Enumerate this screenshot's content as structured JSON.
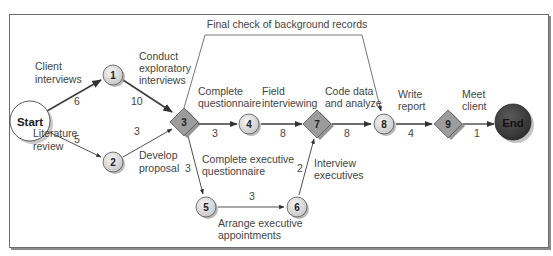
{
  "diagram": {
    "type": "PERT network (activity-on-arrow)",
    "colors": {
      "frame_border": "#6d6d6d",
      "edge": "#444444",
      "circle_node_fill": "#dcdcdc",
      "diamond_node_fill": "#9a9a9a",
      "start_fill": "#ffffff",
      "end_fill": "#3a3a3a",
      "text": "#444444"
    },
    "nodes": [
      {
        "id": "start",
        "label": "Start",
        "shape": "circle-large"
      },
      {
        "id": "1",
        "label": "1",
        "shape": "circle"
      },
      {
        "id": "2",
        "label": "2",
        "shape": "circle"
      },
      {
        "id": "3",
        "label": "3",
        "shape": "diamond"
      },
      {
        "id": "4",
        "label": "4",
        "shape": "circle"
      },
      {
        "id": "5",
        "label": "5",
        "shape": "circle"
      },
      {
        "id": "6",
        "label": "6",
        "shape": "circle"
      },
      {
        "id": "7",
        "label": "7",
        "shape": "diamond"
      },
      {
        "id": "8",
        "label": "8",
        "shape": "circle"
      },
      {
        "id": "9",
        "label": "9",
        "shape": "diamond"
      },
      {
        "id": "end",
        "label": "End",
        "shape": "circle-large-dark"
      }
    ],
    "edges": [
      {
        "from": "start",
        "to": "1",
        "duration": "6",
        "activity": [
          "Client",
          "interviews"
        ],
        "critical": true
      },
      {
        "from": "start",
        "to": "2",
        "duration": "5",
        "activity": [
          "Literature",
          "review"
        ],
        "critical": false
      },
      {
        "from": "1",
        "to": "3",
        "duration": "10",
        "activity": [
          "Conduct",
          "exploratory",
          "interviews"
        ],
        "critical": true
      },
      {
        "from": "2",
        "to": "3",
        "duration": "3",
        "activity": [
          "Develop",
          "proposal"
        ],
        "critical": false
      },
      {
        "from": "3",
        "to": "4",
        "duration": "3",
        "activity": [
          "Complete",
          "questionnaire"
        ],
        "critical": true
      },
      {
        "from": "3",
        "to": "5",
        "duration": "3",
        "activity": [
          "Complete executive",
          "questionnaire"
        ],
        "critical": false
      },
      {
        "from": "3",
        "to": "8",
        "duration": "",
        "activity": [
          "Final check of background records"
        ],
        "critical": false
      },
      {
        "from": "4",
        "to": "7",
        "duration": "8",
        "activity": [
          "Field",
          "interviewing"
        ],
        "critical": true
      },
      {
        "from": "5",
        "to": "6",
        "duration": "3",
        "activity": [
          "Arrange executive",
          "appointments"
        ],
        "critical": false
      },
      {
        "from": "6",
        "to": "7",
        "duration": "2",
        "activity": [
          "Interview",
          "executives"
        ],
        "critical": false
      },
      {
        "from": "7",
        "to": "8",
        "duration": "8",
        "activity": [
          "Code data",
          "and analyze"
        ],
        "critical": true
      },
      {
        "from": "8",
        "to": "9",
        "duration": "4",
        "activity": [
          "Write",
          "report"
        ],
        "critical": true
      },
      {
        "from": "9",
        "to": "end",
        "duration": "1",
        "activity": [
          "Meet",
          "client"
        ],
        "critical": true
      }
    ]
  }
}
